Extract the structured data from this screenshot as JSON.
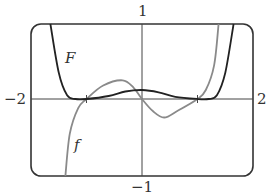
{
  "chart_data": {
    "type": "line",
    "title": "",
    "xlabel": "",
    "ylabel": "",
    "xlim": [
      -2,
      2
    ],
    "ylim": [
      -1,
      1
    ],
    "grid": false,
    "tick_labels": {
      "x_min": "−2",
      "x_max": "2",
      "y_max": "1",
      "y_min": "−1"
    },
    "x_ticks": [
      -1,
      1
    ],
    "series": [
      {
        "name": "F",
        "color": "#222222",
        "description": "antiderivative; steep descent from top near x=-1.65, flat near 0 at x=-1, small positive hump max ~0.12 at x=0, flat near 0 at x=1, steep rise to top near x=1.65",
        "points": [
          [
            -1.65,
            1.0
          ],
          [
            -1.5,
            0.35
          ],
          [
            -1.35,
            0.05
          ],
          [
            -1.2,
            0.0
          ],
          [
            -1.0,
            0.0
          ],
          [
            -0.6,
            0.04
          ],
          [
            -0.3,
            0.1
          ],
          [
            0.0,
            0.12
          ],
          [
            0.3,
            0.09
          ],
          [
            0.6,
            0.03
          ],
          [
            1.0,
            0.0
          ],
          [
            1.2,
            0.0
          ],
          [
            1.35,
            0.05
          ],
          [
            1.5,
            0.35
          ],
          [
            1.65,
            1.0
          ]
        ]
      },
      {
        "name": "f",
        "color": "#8a8a8a",
        "description": "derivative; rises from bottom near x=-1.38, crosses 0 at x=-1, max ~0.25 at x=-0.35, crosses 0 at x=0, min ~-0.24 at x=0.4, crosses 0 at x=1, rises to top near x=1.38",
        "points": [
          [
            -1.38,
            -1.0
          ],
          [
            -1.3,
            -0.45
          ],
          [
            -1.15,
            -0.12
          ],
          [
            -1.0,
            0.0
          ],
          [
            -0.7,
            0.18
          ],
          [
            -0.35,
            0.25
          ],
          [
            -0.15,
            0.15
          ],
          [
            0.0,
            0.0
          ],
          [
            0.2,
            -0.16
          ],
          [
            0.4,
            -0.24
          ],
          [
            0.65,
            -0.15
          ],
          [
            1.0,
            0.0
          ],
          [
            1.15,
            0.12
          ],
          [
            1.3,
            0.45
          ],
          [
            1.38,
            1.0
          ]
        ]
      }
    ],
    "curve_labels": [
      {
        "text": "F",
        "x": -1.55,
        "y": 0.6
      },
      {
        "text": "f",
        "x": -1.25,
        "y": -0.55
      }
    ]
  }
}
